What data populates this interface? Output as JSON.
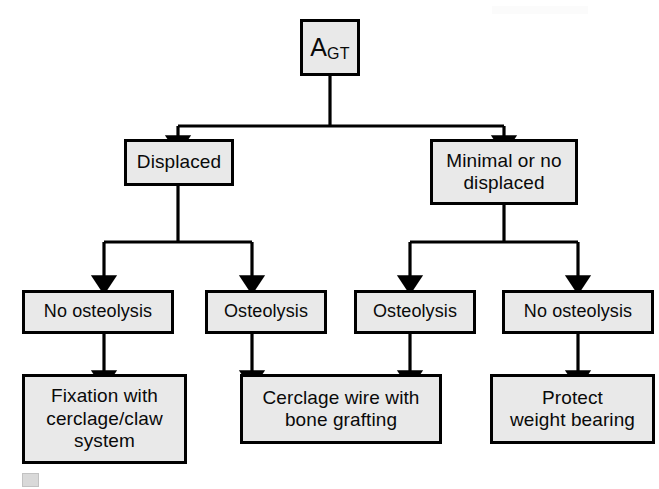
{
  "diagram": {
    "colors": {
      "box_fill": "#e9e9e9",
      "box_border": "#000000",
      "connector": "#000000",
      "text": "#0a0a0a",
      "background": "#ffffff"
    },
    "nodes": {
      "root": {
        "label_main": "A",
        "label_sub": "GT",
        "full_label": "A GT"
      },
      "level2": [
        {
          "id": "displaced",
          "label": "Displaced"
        },
        {
          "id": "minimal-or-no-displaced",
          "label": "Minimal or no\ndisplaced"
        }
      ],
      "level3": [
        {
          "id": "displaced-no-osteolysis",
          "label": "No osteolysis"
        },
        {
          "id": "displaced-osteolysis",
          "label": "Osteolysis"
        },
        {
          "id": "minimal-osteolysis",
          "label": "Osteolysis"
        },
        {
          "id": "minimal-no-osteolysis",
          "label": "No osteolysis"
        }
      ],
      "outcomes": [
        {
          "id": "fixation-cerclage-claw",
          "label": "Fixation with\ncerclage/claw\nsystem"
        },
        {
          "id": "cerclage-wire-bone-grafting",
          "label": "Cerclage wire with\nbone grafting"
        },
        {
          "id": "protect-weight-bearing",
          "label": "Protect\nweight bearing"
        }
      ]
    },
    "edges": [
      {
        "from": "root",
        "to": "displaced"
      },
      {
        "from": "root",
        "to": "minimal-or-no-displaced"
      },
      {
        "from": "displaced",
        "to": "displaced-no-osteolysis"
      },
      {
        "from": "displaced",
        "to": "displaced-osteolysis"
      },
      {
        "from": "minimal-or-no-displaced",
        "to": "minimal-osteolysis"
      },
      {
        "from": "minimal-or-no-displaced",
        "to": "minimal-no-osteolysis"
      },
      {
        "from": "displaced-no-osteolysis",
        "to": "fixation-cerclage-claw"
      },
      {
        "from": "displaced-osteolysis",
        "to": "cerclage-wire-bone-grafting"
      },
      {
        "from": "minimal-osteolysis",
        "to": "cerclage-wire-bone-grafting"
      },
      {
        "from": "minimal-no-osteolysis",
        "to": "protect-weight-bearing"
      }
    ]
  }
}
